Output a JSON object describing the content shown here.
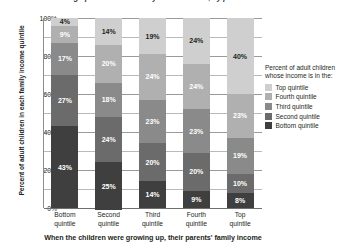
{
  "chart_data": {
    "type": "bar",
    "stacked": true,
    "stack_total": 100,
    "title": "Chances of moving up or down the family income ladder, by parents' income",
    "xlabel": "When the children were growing up, their parents' family income",
    "ylabel": "Percent of adult children in each family income quintile",
    "categories": [
      "Bottom quintile",
      "Second quintile",
      "Third quintile",
      "Fourth quintile",
      "Top quintile"
    ],
    "category_lines": [
      [
        "Bottom",
        "quintile"
      ],
      [
        "Second",
        "quintile"
      ],
      [
        "Third",
        "quintile"
      ],
      [
        "Fourth",
        "quintile"
      ],
      [
        "Top",
        "quintile"
      ]
    ],
    "series": [
      {
        "name": "Top quintile",
        "color": "#cfcfcf",
        "label_color": "#231f20",
        "values": [
          4,
          14,
          19,
          24,
          40
        ]
      },
      {
        "name": "Fourth quintile",
        "color": "#b0b0b0",
        "label_color": "#ffffff",
        "values": [
          9,
          20,
          24,
          24,
          23
        ]
      },
      {
        "name": "Third quintile",
        "color": "#8a8a8a",
        "label_color": "#ffffff",
        "values": [
          17,
          18,
          23,
          23,
          19
        ]
      },
      {
        "name": "Second quintile",
        "color": "#6b6b6b",
        "label_color": "#ffffff",
        "values": [
          27,
          24,
          20,
          20,
          10
        ]
      },
      {
        "name": "Bottom quintile",
        "color": "#3f3f3f",
        "label_color": "#ffffff",
        "values": [
          43,
          25,
          14,
          9,
          8
        ]
      }
    ],
    "segment_labels": [
      [
        "4%",
        "14%",
        "19%",
        "24%",
        "40%"
      ],
      [
        "9%",
        "20%",
        "24%",
        "24%",
        "23%"
      ],
      [
        "17%",
        "18%",
        "23%",
        "23%",
        "19%"
      ],
      [
        "27%",
        "24%",
        "20%",
        "20%",
        "10%"
      ],
      [
        "43%",
        "25%",
        "14%",
        "9%",
        "8%"
      ]
    ],
    "ylim": [
      0,
      100
    ],
    "y_ticks": [
      0,
      10,
      20,
      30,
      40,
      50,
      60,
      70,
      80,
      90,
      100
    ],
    "y_tick_labels": [
      "0%",
      "20%",
      "40%",
      "60%",
      "80%",
      "100%"
    ],
    "y_tick_label_values": [
      0,
      20,
      40,
      60,
      80,
      100
    ],
    "grid": true,
    "legend_position": "right"
  },
  "legend": {
    "title": "Percent of adult children whose income is in the:",
    "items": [
      {
        "label": "Top quintile",
        "color": "#cfcfcf"
      },
      {
        "label": "Fourth quintile",
        "color": "#b0b0b0"
      },
      {
        "label": "Third quintile",
        "color": "#8a8a8a"
      },
      {
        "label": "Second quintile",
        "color": "#6b6b6b"
      },
      {
        "label": "Bottom quintile",
        "color": "#3f3f3f"
      }
    ]
  },
  "axes": {
    "y_title": "Percent of adult children in each family income quintile",
    "x_title": "When the children were growing up, their parents' family income",
    "y_labels": [
      "100%",
      "80%",
      "60%",
      "40%",
      "20%",
      "0%"
    ]
  },
  "title": "Chances of moving up or down the family income ladder, by parents' income"
}
